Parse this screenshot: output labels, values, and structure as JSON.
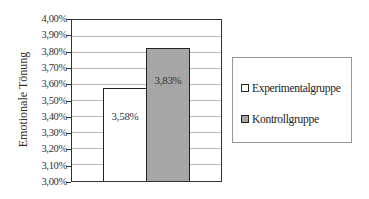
{
  "chart_data": {
    "type": "bar",
    "title": "",
    "xlabel": "",
    "ylabel": "Emotionale Tönung",
    "ylim": [
      3.0,
      4.0
    ],
    "yticks": [
      "4,00%",
      "3,90%",
      "3,80%",
      "3,70%",
      "3,60%",
      "3,50%",
      "3,40%",
      "3,30%",
      "3,20%",
      "3,10%",
      "3,00%"
    ],
    "grid": true,
    "legend_position": "right",
    "categories": [
      ""
    ],
    "series": [
      {
        "name": "Experimentalgruppe",
        "values": [
          3.58
        ],
        "label": "3,58%",
        "color": "#ffffff"
      },
      {
        "name": "Kontrollgruppe",
        "values": [
          3.83
        ],
        "label": "3,83%",
        "color": "#a6a6a6"
      }
    ]
  },
  "legend": {
    "items": [
      {
        "label": "Experimentalgruppe",
        "color": "#ffffff"
      },
      {
        "label": "Kontrollgruppe",
        "color": "#a6a6a6"
      }
    ]
  }
}
